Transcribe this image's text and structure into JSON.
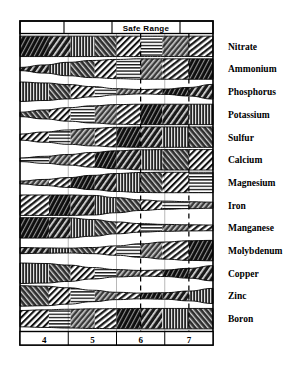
{
  "chart_data": {
    "type": "area",
    "title": "",
    "xlabel": "",
    "ylabel": "",
    "header_label": "Safe Range",
    "xlim": [
      3.5,
      7.5
    ],
    "x_ticks": [
      4,
      5,
      6,
      7
    ],
    "x_tick_labels": [
      "4",
      "5",
      "6",
      "7"
    ],
    "grid": false,
    "legend": "none",
    "annotations": [
      "Safe Range"
    ],
    "safe_range": [
      6.0,
      7.0
    ],
    "column_dividers": [
      4.5,
      5.5,
      6.5
    ],
    "dashed_lines": [
      6.0,
      7.0
    ],
    "series": [
      {
        "name": "Nitrate",
        "x": [
          3.5,
          4.0,
          4.5,
          5.0,
          5.5,
          6.0,
          6.5,
          7.0,
          7.5
        ],
        "values": [
          1.0,
          1.0,
          1.0,
          1.0,
          1.0,
          1.0,
          1.0,
          1.0,
          1.0
        ]
      },
      {
        "name": "Ammonium",
        "x": [
          3.5,
          4.0,
          4.5,
          5.0,
          5.5,
          6.0,
          6.5,
          7.0,
          7.5
        ],
        "values": [
          0.16,
          0.4,
          0.66,
          0.84,
          0.94,
          1.0,
          1.0,
          1.0,
          1.0
        ]
      },
      {
        "name": "Phosphorus",
        "x": [
          3.5,
          4.0,
          4.5,
          5.0,
          5.5,
          6.0,
          6.5,
          7.0,
          7.5
        ],
        "values": [
          0.95,
          0.86,
          0.7,
          0.5,
          0.3,
          0.22,
          0.26,
          0.42,
          0.72
        ]
      },
      {
        "name": "Potassium",
        "x": [
          3.5,
          4.0,
          4.5,
          5.0,
          5.5,
          6.0,
          6.5,
          7.0,
          7.5
        ],
        "values": [
          0.22,
          0.44,
          0.66,
          0.84,
          0.96,
          1.0,
          1.0,
          1.0,
          1.0
        ]
      },
      {
        "name": "Sulfur",
        "x": [
          3.5,
          4.0,
          4.5,
          5.0,
          5.5,
          6.0,
          6.5,
          7.0,
          7.5
        ],
        "values": [
          0.3,
          0.5,
          0.7,
          0.86,
          0.96,
          1.0,
          1.0,
          1.0,
          1.0
        ]
      },
      {
        "name": "Calcium",
        "x": [
          3.5,
          4.0,
          4.5,
          5.0,
          5.5,
          6.0,
          6.5,
          7.0,
          7.5
        ],
        "values": [
          0.18,
          0.34,
          0.52,
          0.72,
          0.88,
          0.98,
          1.0,
          1.0,
          1.0
        ]
      },
      {
        "name": "Magnesium",
        "x": [
          3.5,
          4.0,
          4.5,
          5.0,
          5.5,
          6.0,
          6.5,
          7.0,
          7.5
        ],
        "values": [
          0.14,
          0.3,
          0.48,
          0.7,
          0.88,
          0.98,
          1.0,
          1.0,
          1.0
        ]
      },
      {
        "name": "Iron",
        "x": [
          3.5,
          4.0,
          4.5,
          5.0,
          5.5,
          6.0,
          6.5,
          7.0,
          7.5
        ],
        "values": [
          1.0,
          1.0,
          1.0,
          0.96,
          0.74,
          0.52,
          0.4,
          0.34,
          0.3
        ]
      },
      {
        "name": "Manganese",
        "x": [
          3.5,
          4.0,
          4.5,
          5.0,
          5.5,
          6.0,
          6.5,
          7.0,
          7.5
        ],
        "values": [
          1.0,
          1.0,
          0.98,
          0.82,
          0.58,
          0.42,
          0.34,
          0.3,
          0.28
        ]
      },
      {
        "name": "Molybdenum",
        "x": [
          3.5,
          4.0,
          4.5,
          5.0,
          5.5,
          6.0,
          6.5,
          7.0,
          7.5
        ],
        "values": [
          0.3,
          0.26,
          0.24,
          0.3,
          0.46,
          0.66,
          0.84,
          0.96,
          1.0
        ]
      },
      {
        "name": "Copper",
        "x": [
          3.5,
          4.0,
          4.5,
          5.0,
          5.5,
          6.0,
          6.5,
          7.0,
          7.5
        ],
        "values": [
          1.0,
          0.96,
          0.8,
          0.56,
          0.36,
          0.28,
          0.32,
          0.48,
          0.74
        ]
      },
      {
        "name": "Zinc",
        "x": [
          3.5,
          4.0,
          4.5,
          5.0,
          5.5,
          6.0,
          6.5,
          7.0,
          7.5
        ],
        "values": [
          1.0,
          0.96,
          0.8,
          0.56,
          0.36,
          0.28,
          0.32,
          0.48,
          0.74
        ]
      },
      {
        "name": "Boron",
        "x": [
          3.5,
          4.0,
          4.5,
          5.0,
          5.5,
          6.0,
          6.5,
          7.0,
          7.5
        ],
        "values": [
          0.8,
          0.86,
          0.92,
          0.96,
          0.98,
          1.0,
          1.0,
          1.0,
          1.0
        ]
      }
    ]
  },
  "chart": {
    "header": {
      "safe_range_label": "Safe Range"
    },
    "axis": {
      "ticks": [
        {
          "label": "4"
        },
        {
          "label": "5"
        },
        {
          "label": "6"
        },
        {
          "label": "7"
        }
      ]
    },
    "row_labels": [
      {
        "text": "Nitrate"
      },
      {
        "text": "Ammonium"
      },
      {
        "text": "Phosphorus"
      },
      {
        "text": "Potassium"
      },
      {
        "text": "Sulfur"
      },
      {
        "text": "Calcium"
      },
      {
        "text": "Magnesium"
      },
      {
        "text": "Iron"
      },
      {
        "text": "Manganese"
      },
      {
        "text": "Molybdenum"
      },
      {
        "text": "Copper"
      },
      {
        "text": "Zinc"
      },
      {
        "text": "Boron"
      }
    ]
  },
  "colors": {
    "ink": "#000000",
    "paper": "#ffffff",
    "band_fill": "#2b2b2b"
  }
}
